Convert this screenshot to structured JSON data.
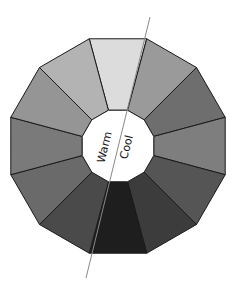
{
  "diagram": {
    "type": "color-wheel",
    "center_labels": {
      "warm": "Warm",
      "cool": "Cool"
    },
    "segments": [
      {
        "position": "top",
        "color": "#dcdcdc"
      },
      {
        "position": "top-right-1",
        "color": "#9a9a9a"
      },
      {
        "position": "top-right-2",
        "color": "#6e6e6e"
      },
      {
        "position": "right-upper",
        "color": "#7e7e7e"
      },
      {
        "position": "right-lower",
        "color": "#767676"
      },
      {
        "position": "bottom-right-2",
        "color": "#555555"
      },
      {
        "position": "bottom-right-1",
        "color": "#3c3c3c"
      },
      {
        "position": "bottom",
        "color": "#1e1e1e"
      },
      {
        "position": "bottom-left-1",
        "color": "#4a4a4a"
      },
      {
        "position": "bottom-left-2",
        "color": "#6a6a6a"
      },
      {
        "position": "left-lower",
        "color": "#7a7a7a"
      },
      {
        "position": "left-upper",
        "color": "#959595"
      },
      {
        "position": "top-left-2",
        "color": "#a8a8a8"
      },
      {
        "position": "top-left-1",
        "color": "#b9b9b9"
      }
    ],
    "divider_line_color": "#888888"
  }
}
